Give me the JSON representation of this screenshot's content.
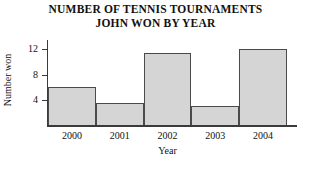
{
  "chart_data": {
    "type": "bar",
    "title": "NUMBER OF TENNIS TOURNAMENTS JOHN WON BY YEAR",
    "title_lines": [
      "NUMBER OF TENNIS TOURNAMENTS",
      "JOHN WON BY YEAR"
    ],
    "categories": [
      "2000",
      "2001",
      "2002",
      "2003",
      "2004"
    ],
    "values": [
      6,
      3.5,
      11.5,
      3,
      12
    ],
    "xlabel": "Year",
    "ylabel": "Number won",
    "ylim": [
      0,
      13.5
    ],
    "yticks": [
      4,
      8,
      12
    ],
    "ytick_labels": [
      "4",
      "8",
      "12"
    ],
    "grid": false,
    "legend": "none",
    "bar_fill_color": "#d5d5d5",
    "bar_edge_color": "#4a4a4a",
    "axis_color": "#3a3a3a",
    "background_color": "#ffffff"
  }
}
